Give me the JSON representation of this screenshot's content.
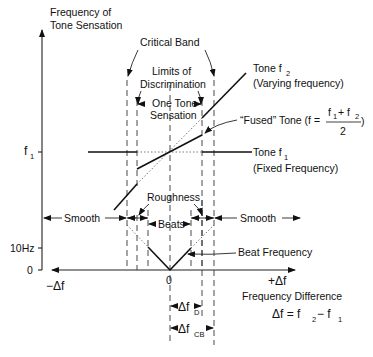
{
  "y_axis": {
    "title_line1": "Frequency of",
    "title_line2": "Tone Sensation",
    "ticks": {
      "f1_main": "f",
      "f1_sub": "1",
      "ten_hz": "10Hz",
      "zero": "0"
    }
  },
  "x_axis": {
    "neg_label": "−Δf",
    "pos_label": "+Δf",
    "zero": "0",
    "title": "Frequency Difference",
    "formula_main": "Δf = f",
    "formula_sub2": "2",
    "formula_minus": " − f",
    "formula_sub1": "1"
  },
  "annotations": {
    "critical_band": "Critical Band",
    "limits_line1": "Limits of",
    "limits_line2": "Discrimination",
    "one_tone_line1": "One Tone",
    "one_tone_line2": "Sensation",
    "tone_f2_main": "Tone f",
    "tone_f2_sub": "2",
    "tone_f2_desc": "(Varying frequency)",
    "fused_label": "“Fused” Tone (f =",
    "fused_num": "f",
    "fused_num_sub1": "1",
    "fused_num_plus": " + f",
    "fused_num_sub2": "2",
    "fused_den": "2",
    "fused_close": ")",
    "tone_f1_main": "Tone f",
    "tone_f1_sub": "1",
    "tone_f1_desc": "(Fixed Frequency)",
    "roughness": "Roughness",
    "beats": "Beats",
    "smooth_left": "Smooth",
    "smooth_right": "Smooth",
    "beat_frequency": "Beat Frequency",
    "delta_fd_main": "Δf",
    "delta_fd_sub": "D",
    "delta_fcb_main": "Δf",
    "delta_fcb_sub": "CB"
  }
}
